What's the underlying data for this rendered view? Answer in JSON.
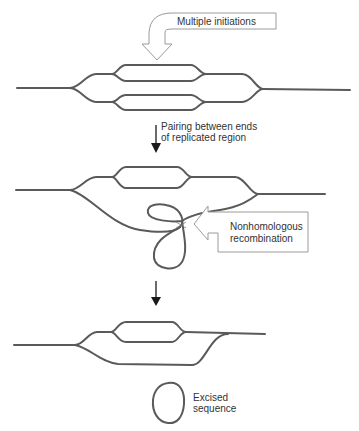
{
  "diagram": {
    "colors": {
      "strand": "#5a5a5a",
      "callout_border": "#9a9a9a",
      "arrow": "#1a1a1a",
      "text": "#333333"
    },
    "stage1": {
      "callout_label": "Multiple initiations"
    },
    "step1": {
      "label_line1": "Pairing between ends",
      "label_line2": "of replicated region"
    },
    "stage2": {
      "callout_label_line1": "Nonhomologous",
      "callout_label_line2": "recombination"
    },
    "stage3": {
      "label_line1": "Excised",
      "label_line2": "sequence"
    }
  }
}
